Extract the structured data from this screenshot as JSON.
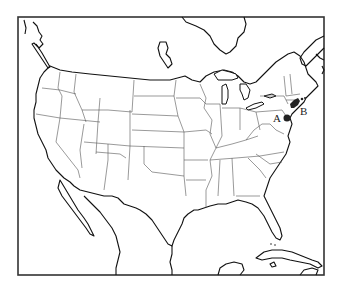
{
  "map": {
    "title": "",
    "region": "Contiguous United States with state boundaries",
    "colors": {
      "background": "#ffffff",
      "outline": "#111111",
      "state_lines": "#555555",
      "markers": "#222222"
    },
    "markers": [
      {
        "id": "A",
        "label": "A",
        "description": "Mid-Atlantic point near southeastern Pennsylvania"
      },
      {
        "id": "B",
        "label": "B",
        "description": "Northeast coastal point near southern New England"
      }
    ]
  }
}
